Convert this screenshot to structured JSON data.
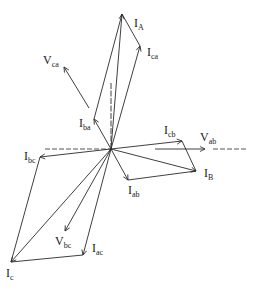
{
  "diagram": {
    "type": "phasor-diagram",
    "origin": [
      111,
      149
    ],
    "reference_axis": {
      "left": [
        45,
        149
      ],
      "right_dashed": [
        213,
        248
      ],
      "vertical_top": [
        111,
        83
      ]
    },
    "vectors": [
      {
        "id": "I_A",
        "from": [
          111,
          149
        ],
        "to": [
          122,
          14
        ],
        "label_main": "I",
        "label_sub": "A",
        "label_pos": [
          134,
          28
        ]
      },
      {
        "id": "I_ca",
        "from": [
          111,
          149
        ],
        "to": [
          140,
          46
        ],
        "label_main": "I",
        "label_sub": "ca",
        "label_pos": [
          148,
          57
        ]
      },
      {
        "id": "I_ba",
        "from": [
          111,
          149
        ],
        "to": [
          94,
          119
        ],
        "label_main": "I",
        "label_sub": "ba",
        "label_pos": [
          80,
          127
        ]
      },
      {
        "id": "I_cb",
        "from": [
          111,
          149
        ],
        "to": [
          182,
          141
        ],
        "label_main": "I",
        "label_sub": "cb",
        "label_pos": [
          164,
          134
        ]
      },
      {
        "id": "I_bc",
        "from": [
          111,
          149
        ],
        "to": [
          40,
          157
        ],
        "label_main": "I",
        "label_sub": "bc",
        "label_pos": [
          25,
          160
        ]
      },
      {
        "id": "I_ab",
        "from": [
          111,
          149
        ],
        "to": [
          128,
          180
        ],
        "label_main": "I",
        "label_sub": "ab",
        "label_pos": [
          128,
          196
        ]
      },
      {
        "id": "I_B",
        "from": [
          111,
          149
        ],
        "to": [
          196,
          171
        ],
        "label_main": "I",
        "label_sub": "B",
        "label_pos": [
          205,
          178
        ]
      },
      {
        "id": "I_ac",
        "from": [
          111,
          149
        ],
        "to": [
          83,
          255
        ],
        "label_main": "I",
        "label_sub": "ac",
        "label_pos": [
          92,
          253
        ]
      },
      {
        "id": "I_c",
        "from": [
          111,
          149
        ],
        "to": [
          11,
          262
        ],
        "label_main": "I",
        "label_sub": "c",
        "label_pos": [
          6,
          279
        ]
      },
      {
        "id": "V_bc",
        "from": [
          111,
          149
        ],
        "to": [
          65,
          231
        ],
        "label_main": "V",
        "label_sub": "bc",
        "label_pos": [
          55,
          246
        ]
      }
    ],
    "free_arrows": [
      {
        "id": "V_ca",
        "from": [
          89,
          108
        ],
        "to": [
          64,
          67
        ],
        "label_main": "V",
        "label_sub": "ca",
        "label_pos": [
          43,
          64
        ]
      },
      {
        "id": "V_ab",
        "from": [
          155,
          149
        ],
        "to": [
          205,
          149
        ],
        "label_main": "V",
        "label_sub": "ab",
        "label_pos": [
          201,
          141
        ]
      }
    ],
    "construction_lines": [
      {
        "id": "I_ba-to-I_A",
        "from": [
          94,
          119
        ],
        "to": [
          122,
          14
        ]
      },
      {
        "id": "I_ca-to-I_A",
        "from": [
          140,
          46
        ],
        "to": [
          122,
          14
        ]
      },
      {
        "id": "I_cb-to-I_B",
        "from": [
          182,
          141
        ],
        "to": [
          196,
          171
        ]
      },
      {
        "id": "I_ab-to-I_B",
        "from": [
          128,
          180
        ],
        "to": [
          196,
          171
        ]
      },
      {
        "id": "I_bc-to-I_c",
        "from": [
          40,
          157
        ],
        "to": [
          11,
          262
        ]
      },
      {
        "id": "I_ac-to-I_c",
        "from": [
          83,
          255
        ],
        "to": [
          11,
          262
        ]
      }
    ],
    "labels": {
      "I_A": {
        "main": "I",
        "sub": "A"
      },
      "I_ca": {
        "main": "I",
        "sub": "ca"
      },
      "V_ca": {
        "main": "V",
        "sub": "ca"
      },
      "I_ba": {
        "main": "I",
        "sub": "ba"
      },
      "I_cb": {
        "main": "I",
        "sub": "cb"
      },
      "V_ab": {
        "main": "V",
        "sub": "ab"
      },
      "I_bc": {
        "main": "I",
        "sub": "bc"
      },
      "I_ab": {
        "main": "I",
        "sub": "ab"
      },
      "I_B": {
        "main": "I",
        "sub": "B"
      },
      "V_bc": {
        "main": "V",
        "sub": "bc"
      },
      "I_ac": {
        "main": "I",
        "sub": "ac"
      },
      "I_c": {
        "main": "I",
        "sub": "c"
      }
    },
    "colors": {
      "line": "#2a2a2a",
      "background": "#ffffff"
    }
  }
}
